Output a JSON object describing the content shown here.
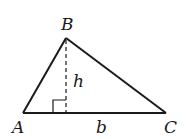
{
  "diagram": {
    "type": "triangle-area",
    "vertices": {
      "A": {
        "label": "A",
        "x": 23,
        "y": 113
      },
      "B": {
        "label": "B",
        "x": 66,
        "y": 38
      },
      "C": {
        "label": "C",
        "x": 166,
        "y": 113
      }
    },
    "altitude": {
      "label": "h",
      "style": "dashed"
    },
    "base": {
      "label": "b"
    },
    "right_angle_marker": true,
    "colors": {
      "stroke": "#1a1a1a",
      "background": "#ffffff"
    }
  }
}
